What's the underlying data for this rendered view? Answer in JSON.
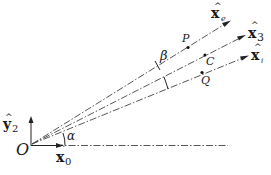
{
  "diagram": {
    "origin_label": "O",
    "axes": {
      "x0": {
        "base": "x",
        "hat": "^",
        "sub": "0"
      },
      "y2": {
        "base": "y",
        "hat": "^",
        "sub": "2"
      }
    },
    "rays": [
      {
        "id": "xe",
        "base": "x",
        "hat": "^",
        "sub": "e",
        "point": "P"
      },
      {
        "id": "x3",
        "base": "x",
        "hat": "^",
        "sub": "3",
        "point": "C"
      },
      {
        "id": "xi",
        "base": "x",
        "hat": "^",
        "sub": "i",
        "point": "Q"
      }
    ],
    "angles": {
      "alpha": "α",
      "beta": "β"
    },
    "points": {
      "P": "P",
      "C": "C",
      "Q": "Q"
    }
  }
}
